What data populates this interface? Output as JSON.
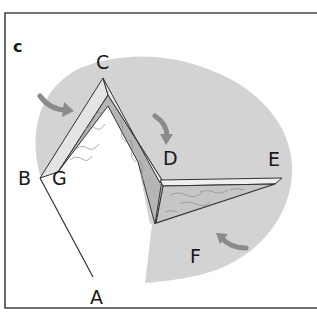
{
  "figure": {
    "panel_label": "c",
    "point_labels": {
      "A": "A",
      "B": "B",
      "C": "C",
      "D": "D",
      "E": "E",
      "F": "F",
      "G": "G"
    },
    "colors": {
      "background_blob": "#d3d3d3",
      "tissue_fill": "#b8b8b8",
      "tissue_light": "#e6e6e6",
      "line": "#333333",
      "arrow": "#8a8a8a",
      "frame": "#444444"
    },
    "arrows": [
      {
        "name": "arrow-near-c-left",
        "direction": "right-down"
      },
      {
        "name": "arrow-near-d",
        "direction": "down"
      },
      {
        "name": "arrow-near-f",
        "direction": "left-up"
      }
    ]
  }
}
